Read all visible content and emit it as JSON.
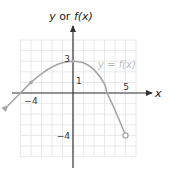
{
  "chart_data": {
    "type": "line",
    "title": "",
    "xlabel": "x",
    "ylabel": "y or f(x)",
    "xlim": [
      -5,
      6
    ],
    "ylim": [
      -6,
      5
    ],
    "grid": true,
    "legend": null,
    "tick_labels": {
      "x": [
        {
          "value": -4,
          "label": "−4"
        },
        {
          "value": 5,
          "label": "5"
        }
      ],
      "y": [
        {
          "value": 3,
          "label": "3"
        },
        {
          "value": 1,
          "label": "1"
        },
        {
          "value": -4,
          "label": "−4"
        }
      ]
    },
    "series": [
      {
        "name": "y = f(x)",
        "x": [
          -6.2,
          -5,
          -4,
          -3,
          -2,
          -1,
          0,
          1,
          2,
          3,
          3.25,
          4,
          5
        ],
        "y": [
          -1.2,
          0,
          1,
          1.8,
          2.45,
          2.85,
          3,
          2.85,
          2.2,
          0.85,
          0,
          -1.6,
          -4
        ],
        "left_end": "arrow",
        "right_end": "open-circle",
        "marked_points": [
          {
            "x": -4,
            "y": 1
          },
          {
            "x": 0,
            "y": 3
          }
        ],
        "open_points": [
          {
            "x": 5,
            "y": -4
          }
        ]
      }
    ],
    "annotations": [
      {
        "text": "y = f(x)",
        "x": 2.1,
        "y": 2.6
      }
    ]
  },
  "labels": {
    "y_axis_title_italic": "y",
    "y_axis_title_mid": " or ",
    "y_axis_title_fn": "f(x)",
    "x_axis_title": "x",
    "function_label": "y = f(x)",
    "tick_x_neg4": "−4",
    "tick_x_5": "5",
    "tick_y_3": "3",
    "tick_y_1": "1",
    "tick_y_neg4": "−4"
  },
  "colors": {
    "grid": "#e3e3e3",
    "axis": "#333333",
    "curve": "#a6a6a6",
    "function_label": "#bdbdbd"
  }
}
